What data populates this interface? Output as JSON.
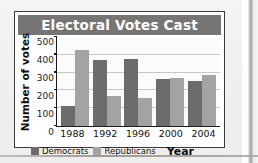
{
  "chart_data": {
    "type": "bar",
    "title": "Electoral Votes Cast",
    "xlabel": "Year",
    "ylabel": "Number of votes",
    "categories": [
      "1988",
      "1992",
      "1996",
      "2000",
      "2004"
    ],
    "series": [
      {
        "name": "Democrats",
        "color": "#6e6c6a",
        "values": [
          111,
          370,
          379,
          266,
          251
        ]
      },
      {
        "name": "Republicans",
        "color": "#a5a3a0",
        "values": [
          426,
          168,
          159,
          271,
          286
        ]
      }
    ],
    "ylim": [
      0,
      500
    ],
    "yticks": [
      0,
      100,
      200,
      300,
      400,
      500
    ],
    "ytick_labels": [
      "0",
      "100",
      "200",
      "300",
      "400",
      "500"
    ],
    "grid": "horizontal",
    "legend_position": "bottom-left",
    "title_banner_color": "#777573"
  },
  "legend": {
    "democrats_label": "Democrats",
    "republicans_label": "Republicans"
  }
}
